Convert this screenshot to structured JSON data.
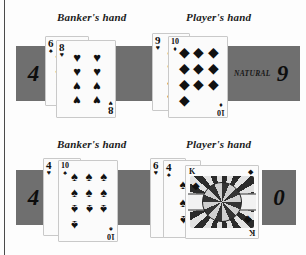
{
  "page": {
    "background_color": "#fdfdfd",
    "box_color": "#6f6f6f",
    "ink_color": "#111111"
  },
  "rounds": [
    {
      "id": "round-top",
      "banker": {
        "label": "Banker's hand",
        "score": "4",
        "cards": [
          {
            "rank": "6",
            "suit": "♠",
            "suit_name": "spade",
            "count": 6,
            "position": "back"
          },
          {
            "rank": "8",
            "suit": "♥",
            "suit_name": "heart",
            "count": 8,
            "position": "front"
          }
        ]
      },
      "player": {
        "label": "Player's hand",
        "score": "9",
        "result_text": "NATURAL",
        "cards": [
          {
            "rank": "9",
            "suit": "♥",
            "suit_name": "heart",
            "count": 9,
            "position": "back"
          },
          {
            "rank": "10",
            "suit": "♦",
            "suit_name": "diamond",
            "count": 10,
            "position": "front"
          }
        ]
      }
    },
    {
      "id": "round-bottom",
      "banker": {
        "label": "Banker's hand",
        "score": "4",
        "cards": [
          {
            "rank": "4",
            "suit": "♥",
            "suit_name": "heart",
            "count": 4,
            "position": "back"
          },
          {
            "rank": "10",
            "suit": "♠",
            "suit_name": "spade",
            "count": 10,
            "position": "front"
          }
        ]
      },
      "player": {
        "label": "Player's hand",
        "score": "0",
        "result_text": "",
        "cards": [
          {
            "rank": "6",
            "suit": "♥",
            "suit_name": "heart",
            "count": 6,
            "position": "back"
          },
          {
            "rank": "4",
            "suit": "♠",
            "suit_name": "spade",
            "count": 4,
            "position": "middle"
          },
          {
            "rank": "K",
            "suit": "♦",
            "suit_name": "diamond",
            "count": 0,
            "position": "front",
            "is_face": true
          }
        ]
      }
    }
  ]
}
